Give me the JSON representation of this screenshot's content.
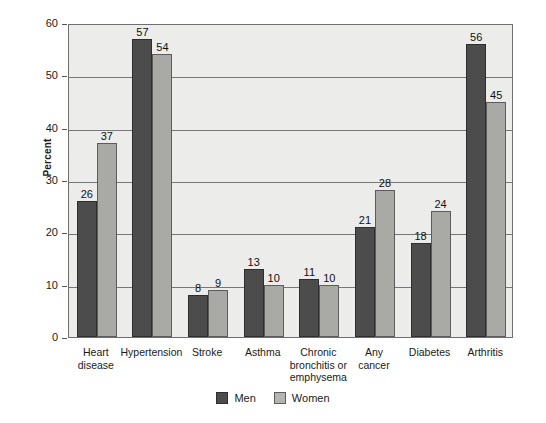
{
  "chart_data": {
    "type": "bar",
    "title": "",
    "subtitle": "",
    "xlabel": "",
    "ylabel": "Percent",
    "ylim": [
      0,
      60
    ],
    "ytick_step": 10,
    "yticks": [
      0,
      10,
      20,
      30,
      40,
      50,
      60
    ],
    "grid": true,
    "legend_position": "bottom-center",
    "categories": [
      "Heart disease",
      "Hypertension",
      "Stroke",
      "Asthma",
      "Chronic bronchitis or emphysema",
      "Any cancer",
      "Diabetes",
      "Arthritis"
    ],
    "category_label_lines": [
      [
        "Heart",
        "disease"
      ],
      [
        "Hypertension"
      ],
      [
        "Stroke"
      ],
      [
        "Asthma"
      ],
      [
        "Chronic",
        "bronchitis or",
        "emphysema"
      ],
      [
        "Any",
        "cancer"
      ],
      [
        "Diabetes"
      ],
      [
        "Arthritis"
      ]
    ],
    "series": [
      {
        "name": "Men",
        "color": "#4c4c4c",
        "values": [
          26,
          57,
          8,
          13,
          11,
          21,
          18,
          56
        ]
      },
      {
        "name": "Women",
        "color": "#a9a9a6",
        "values": [
          37,
          54,
          9,
          10,
          10,
          28,
          24,
          45
        ]
      }
    ]
  },
  "legend": {
    "items": [
      {
        "label": "Men",
        "swatch": "men-swatch"
      },
      {
        "label": "Women",
        "swatch": "women-swatch"
      }
    ]
  },
  "colors": {
    "men": "#4c4c4c",
    "women": "#a9a9a6",
    "plot_background": "#ececeb",
    "gridline": "#77777a",
    "axis": "#6e6e6e",
    "text": "#1a1a1a"
  }
}
